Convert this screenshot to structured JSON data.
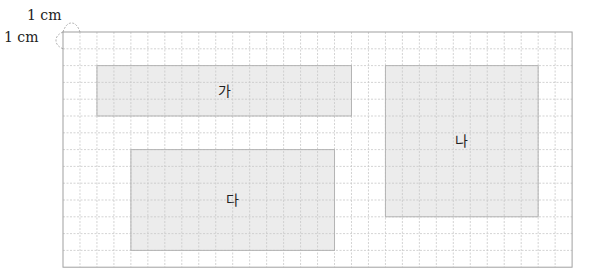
{
  "unit_labels": {
    "top": "1 cm",
    "left": "1 cm"
  },
  "grid": {
    "cols": 30,
    "rows": 14,
    "x0": 63,
    "y0": 32,
    "cell_w": 16.97,
    "cell_h": 16.8,
    "line_color": "#c8c8c8",
    "border_color": "#a0a0a0"
  },
  "shapes": [
    {
      "label": "가",
      "col": 2,
      "row": 2,
      "cols": 15,
      "rows": 3,
      "fill": "#ececec"
    },
    {
      "label": "나",
      "col": 19,
      "row": 2,
      "cols": 9,
      "rows": 9,
      "fill": "#ececec"
    },
    {
      "label": "다",
      "col": 4,
      "row": 7,
      "cols": 12,
      "rows": 6,
      "fill": "#ececec"
    }
  ]
}
